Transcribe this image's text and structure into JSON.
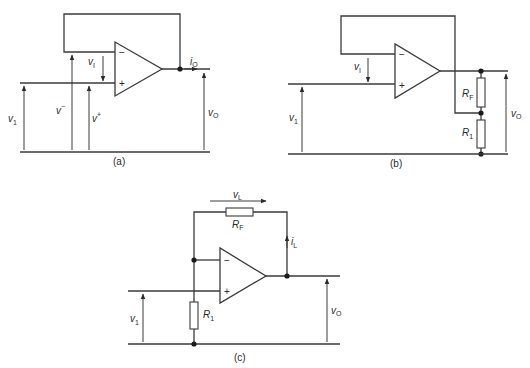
{
  "figure": {
    "panels": [
      {
        "id": "a",
        "caption": "(a)",
        "labels": {
          "vI": {
            "main": "v",
            "sub": "I"
          },
          "v1": {
            "main": "v",
            "sub": "1"
          },
          "vminus": {
            "main": "v",
            "sup": "−"
          },
          "vplus": {
            "main": "v",
            "sup": "+"
          },
          "iO": {
            "main": "i",
            "sub": "O"
          },
          "vO": {
            "main": "v",
            "sub": "O"
          }
        },
        "opamp": {
          "minus": "−",
          "plus": "+"
        }
      },
      {
        "id": "b",
        "caption": "(b)",
        "labels": {
          "vI": {
            "main": "v",
            "sub": "I"
          },
          "v1": {
            "main": "v",
            "sub": "1"
          },
          "RF": {
            "main": "R",
            "sub": "F"
          },
          "R1": {
            "main": "R",
            "sub": "1"
          },
          "vO": {
            "main": "v",
            "sub": "O"
          }
        },
        "opamp": {
          "minus": "−",
          "plus": "+"
        }
      },
      {
        "id": "c",
        "caption": "(c)",
        "labels": {
          "vL": {
            "main": "v",
            "sub": "L"
          },
          "RF": {
            "main": "R",
            "sub": "F"
          },
          "iL": {
            "main": "i",
            "sub": "L"
          },
          "v1": {
            "main": "v",
            "sub": "1"
          },
          "R1": {
            "main": "R",
            "sub": "1"
          },
          "vO": {
            "main": "v",
            "sub": "O"
          }
        },
        "opamp": {
          "minus": "−",
          "plus": "+"
        }
      }
    ]
  }
}
